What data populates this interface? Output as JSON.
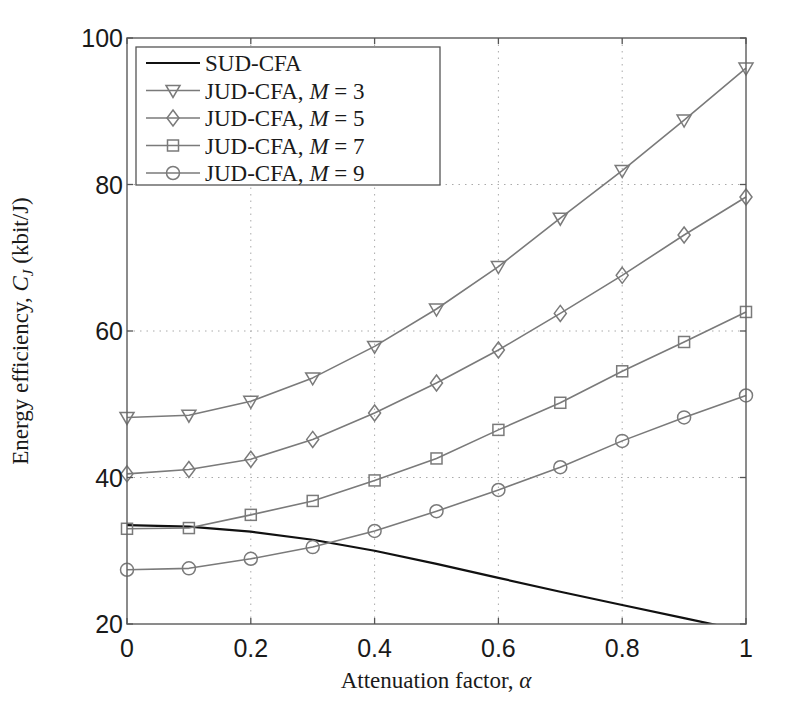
{
  "chart_data": {
    "type": "line",
    "title": "",
    "xlabel": "Attenuation factor, α",
    "ylabel": "Energy efficiency, C_J (kbit/J)",
    "ylabel_parts": {
      "prefix": "Energy efficiency, ",
      "symbol": "C",
      "subscript": "J",
      "unit": " (kbit/J)"
    },
    "xlim": [
      0,
      1
    ],
    "ylim": [
      20,
      100
    ],
    "xticks": [
      0,
      0.2,
      0.4,
      0.6,
      0.8,
      1
    ],
    "xtick_labels": [
      "0",
      "0.2",
      "0.4",
      "0.6",
      "0.8",
      "1"
    ],
    "yticks": [
      20,
      40,
      60,
      80,
      100
    ],
    "ytick_labels": [
      "20",
      "40",
      "60",
      "80",
      "100"
    ],
    "grid": true,
    "legend_position": "upper left",
    "x": [
      0,
      0.1,
      0.2,
      0.3,
      0.4,
      0.5,
      0.6,
      0.7,
      0.8,
      0.9,
      1.0
    ],
    "series": [
      {
        "name": "SUD-CFA",
        "label_main": "SUD-CFA",
        "label_m": "",
        "marker": "none",
        "color": "#111111",
        "width": 2.2,
        "values": [
          33.5,
          33.3,
          32.6,
          31.5,
          30.0,
          28.2,
          26.3,
          24.4,
          22.6,
          20.8,
          19.0
        ]
      },
      {
        "name": "JUD-CFA, M = 3",
        "label_main": "JUD-CFA, ",
        "label_m": "3",
        "marker": "triangle-down",
        "color": "#7a7a7a",
        "width": 1.6,
        "values": [
          48.2,
          48.5,
          50.4,
          53.6,
          57.9,
          63.0,
          68.8,
          75.4,
          81.9,
          88.8,
          95.9
        ]
      },
      {
        "name": "JUD-CFA, M = 5",
        "label_main": "JUD-CFA, ",
        "label_m": "5",
        "marker": "diamond",
        "color": "#7a7a7a",
        "width": 1.6,
        "values": [
          40.5,
          41.1,
          42.5,
          45.2,
          48.8,
          52.9,
          57.4,
          62.4,
          67.6,
          73.1,
          78.3
        ]
      },
      {
        "name": "JUD-CFA, M = 7",
        "label_main": "JUD-CFA, ",
        "label_m": "7",
        "marker": "square",
        "color": "#7a7a7a",
        "width": 1.6,
        "values": [
          33.0,
          33.1,
          34.9,
          36.8,
          39.6,
          42.6,
          46.5,
          50.2,
          54.5,
          58.5,
          62.6
        ]
      },
      {
        "name": "JUD-CFA, M = 9",
        "label_main": "JUD-CFA, ",
        "label_m": "9",
        "marker": "circle",
        "color": "#7a7a7a",
        "width": 1.6,
        "values": [
          27.4,
          27.6,
          28.9,
          30.5,
          32.7,
          35.4,
          38.3,
          41.4,
          45.0,
          48.2,
          51.2
        ]
      }
    ]
  }
}
